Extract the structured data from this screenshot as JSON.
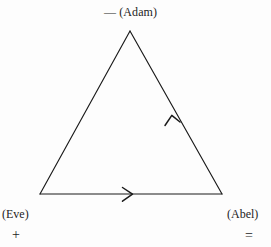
{
  "figure": {
    "type": "triangle-cycle-diagram",
    "background_color": "#fdfdfd",
    "stroke_color": "#1a1a1a",
    "vertices": [
      {
        "id": "adam",
        "label": "(Adam)",
        "sign": "—",
        "position": "top",
        "x": 130,
        "y": 31
      },
      {
        "id": "eve",
        "label": "(Eve)",
        "sign": "+",
        "position": "bottom-left",
        "x": 40,
        "y": 194
      },
      {
        "id": "abel",
        "label": "(Abel)",
        "sign": "=",
        "position": "bottom-right",
        "x": 222,
        "y": 194
      }
    ],
    "edges": [
      {
        "id": "eve-to-abel",
        "from": "eve",
        "to": "abel",
        "arrow": "mid-forward",
        "arrow_at_x": 132,
        "arrow_at_y": 194
      },
      {
        "id": "abel-to-adam",
        "from": "abel",
        "to": "adam",
        "arrow": "mid-forward",
        "arrow_at_x": 172,
        "arrow_at_y": 116
      },
      {
        "id": "adam-to-eve",
        "from": "adam",
        "to": "eve",
        "arrow": "none"
      }
    ]
  }
}
